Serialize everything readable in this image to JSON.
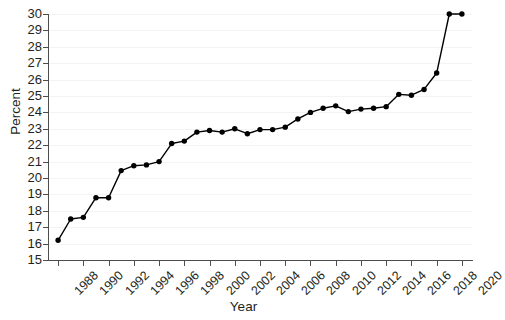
{
  "chart_data": {
    "type": "line",
    "title": "",
    "xlabel": "Year",
    "ylabel": "Percent",
    "xlim": [
      1987.2,
      2020.8
    ],
    "ylim": [
      15,
      30
    ],
    "grid": true,
    "legend": null,
    "marker": "filled-circle",
    "line_color": "#000000",
    "marker_color": "#000000",
    "xtick_labels": [
      "1988",
      "1990",
      "1992",
      "1994",
      "1996",
      "1998",
      "2000",
      "2002",
      "2004",
      "2006",
      "2008",
      "2010",
      "2012",
      "2014",
      "2016",
      "2018",
      "2020"
    ],
    "ytick_labels": [
      "15",
      "16",
      "17",
      "18",
      "19",
      "20",
      "21",
      "22",
      "23",
      "24",
      "25",
      "26",
      "27",
      "28",
      "29",
      "30"
    ],
    "x": [
      1988,
      1989,
      1990,
      1991,
      1992,
      1993,
      1994,
      1995,
      1996,
      1997,
      1998,
      1999,
      2000,
      2001,
      2002,
      2003,
      2004,
      2005,
      2006,
      2007,
      2008,
      2009,
      2010,
      2011,
      2012,
      2013,
      2014,
      2015,
      2016,
      2017,
      2018,
      2019,
      2020
    ],
    "values": [
      16.2,
      17.5,
      17.6,
      18.8,
      18.8,
      20.45,
      20.75,
      20.8,
      21.0,
      22.1,
      22.25,
      22.8,
      22.9,
      22.8,
      23.0,
      22.7,
      22.95,
      22.95,
      23.1,
      23.6,
      24.0,
      24.25,
      24.4,
      24.05,
      24.2,
      24.25,
      24.35,
      25.1,
      25.05,
      25.4,
      26.4,
      30.0,
      30.0
    ]
  }
}
